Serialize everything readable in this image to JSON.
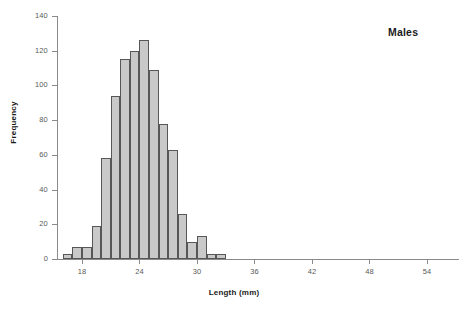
{
  "chart_data": {
    "type": "bar",
    "title": "Males",
    "xlabel": "Length (mm)",
    "ylabel": "Frequency",
    "xlim": [
      15.39,
      57.35
    ],
    "ylim": [
      0,
      140
    ],
    "grid": false,
    "legend": null,
    "bin_width": 1,
    "x_ticks": [
      18,
      24,
      30,
      36,
      42,
      48,
      54
    ],
    "x_tick_labels": [
      "18",
      "24",
      "30",
      "36",
      "42",
      "48",
      "54"
    ],
    "y_ticks": [
      0,
      20,
      40,
      60,
      80,
      100,
      120,
      140
    ],
    "y_tick_labels": [
      "0",
      "20",
      "40",
      "60",
      "80",
      "100",
      "120",
      "140"
    ],
    "bar_color": "#c9c9c9",
    "bar_edge_color": "#575757",
    "axis_color": "#8a8a8a",
    "tick_label_color": "#595959",
    "categories": [
      "16.5",
      "17.5",
      "18.5",
      "19.5",
      "20.5",
      "21.5",
      "22.5",
      "23.5",
      "24.5",
      "25.5",
      "26.5",
      "27.5",
      "28.5",
      "29.5",
      "30.5",
      "31.5",
      "32.5"
    ],
    "bin_starts": [
      16,
      17,
      18,
      19,
      20,
      21,
      22,
      23,
      24,
      25,
      26,
      27,
      28,
      29,
      30,
      31,
      32
    ],
    "values": [
      3,
      7,
      7,
      19,
      58,
      94,
      115,
      120,
      126,
      109,
      78,
      63,
      26,
      10,
      13,
      3,
      3
    ]
  }
}
